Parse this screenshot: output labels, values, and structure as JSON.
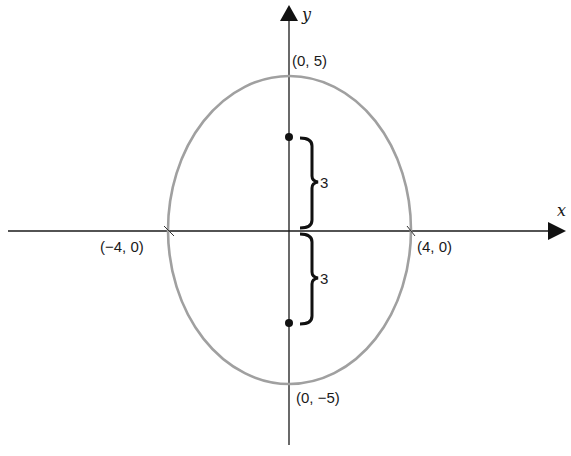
{
  "diagram": {
    "type": "ellipse-with-foci",
    "axes": {
      "x_label": "x",
      "y_label": "y"
    },
    "vertices": {
      "top": "(0, 5)",
      "bottom": "(0, −5)",
      "left": "(−4, 0)",
      "right": "(4, 0)"
    },
    "foci_distance_labels": {
      "upper": "3",
      "lower": "3"
    },
    "colors": {
      "ellipse": "#a0a0a0",
      "axes": "#1a1a1a",
      "foci": "#111111"
    }
  }
}
